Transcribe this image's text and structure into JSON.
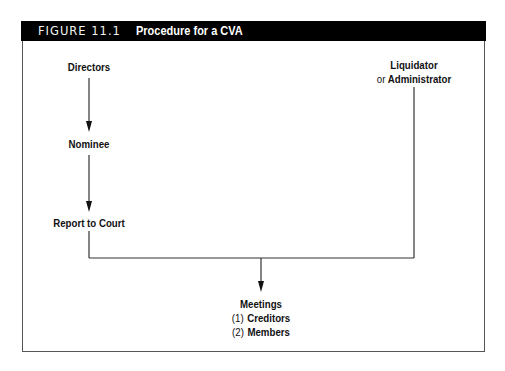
{
  "figure": {
    "number": "FIGURE 11.1",
    "title": "Procedure for a CVA"
  },
  "nodes": {
    "directors": "Directors",
    "nominee": "Nominee",
    "report": "Report to Court",
    "liquidator": "Liquidator",
    "or": "or",
    "administrator": "Administrator",
    "meetings": "Meetings",
    "item1_num": "(1)",
    "item1": "Creditors",
    "item2_num": "(2)",
    "item2": "Members"
  },
  "colors": {
    "header_bg": "#000000",
    "header_text": "#ffffff",
    "line": "#333333"
  }
}
